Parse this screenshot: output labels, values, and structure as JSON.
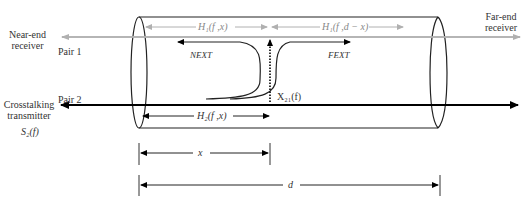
{
  "diagram": {
    "type": "crosstalk-cable-model",
    "labels": {
      "near_end_receiver": "Near-end\nreceiver",
      "near_end_line1": "Near-end",
      "near_end_line2": "receiver",
      "far_end_line1": "Far-end",
      "far_end_line2": "receiver",
      "pair1": "Pair 1",
      "pair2": "Pair 2",
      "crosstalk_tx_line1": "Crosstalking",
      "crosstalk_tx_line2": "transmitter",
      "source": "S₂(f)",
      "h1_near": "H₁(f ,x)",
      "h1_far": "H₁(f ,d − x)",
      "h2": "H₂(f ,x)",
      "next": "NEXT",
      "fext": "FEXT",
      "coupling": "X₂₁(f)",
      "dim_x": "x",
      "dim_d": "d"
    },
    "colors": {
      "pair1_arrow": "#b0b0b0",
      "pair2_arrow": "#000000",
      "outline": "#222222"
    }
  }
}
